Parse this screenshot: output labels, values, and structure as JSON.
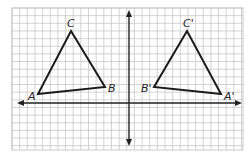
{
  "diagram": {
    "grid": {
      "x0": 12,
      "y0": 8,
      "x1": 243,
      "y1": 150,
      "cell": 7.65,
      "color": "#c8c8c8",
      "border": "#bdbdbd"
    },
    "axes": {
      "x_axis_y": 103,
      "x_min": 17,
      "x_max": 242,
      "y_axis_x": 129,
      "y_min": 10,
      "y_max": 146,
      "color": "#222222"
    },
    "triangles": [
      {
        "name": "ABC",
        "vertices": [
          {
            "label": "A",
            "x": 38,
            "y": 94,
            "lx": 28,
            "ly": 100
          },
          {
            "label": "B",
            "x": 105,
            "y": 87,
            "lx": 108,
            "ly": 92
          },
          {
            "label": "C",
            "x": 71,
            "y": 31,
            "lx": 67,
            "ly": 27
          }
        ]
      },
      {
        "name": "A'B'C'",
        "vertices": [
          {
            "label": "A'",
            "x": 221,
            "y": 94,
            "lx": 224,
            "ly": 100
          },
          {
            "label": "B'",
            "x": 154,
            "y": 87,
            "lx": 141,
            "ly": 92
          },
          {
            "label": "C'",
            "x": 187,
            "y": 31,
            "lx": 183,
            "ly": 27
          }
        ]
      }
    ],
    "stroke_color": "#1a1a1a"
  }
}
